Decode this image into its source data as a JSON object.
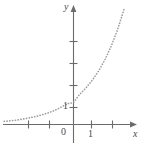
{
  "figure": {
    "background_color": "#ffffff",
    "axis_color": "#6b6b6b",
    "curve_color": "#9a9a9a",
    "text_color": "#4a4a4a"
  },
  "axes": {
    "x_axis_label": "x",
    "y_axis_label": "y",
    "origin_label": "0",
    "x_tick_label": "1",
    "y_tick_label": "1"
  },
  "chart_data": {
    "type": "line",
    "title": "",
    "xlabel": "x",
    "ylabel": "y",
    "grid": false,
    "legend": null,
    "line_style": "dotted",
    "curve_name": "exponential-growth-curve",
    "xlim": [
      -3.3,
      2.45
    ],
    "ylim": [
      -0.35,
      5.4
    ],
    "x_ticks": [
      -3,
      -2,
      -1,
      0,
      1,
      2
    ],
    "x_tick_labels": [
      "",
      "",
      "",
      "0",
      "1",
      ""
    ],
    "y_ticks": [
      1,
      2,
      3,
      4,
      5
    ],
    "y_tick_labels": [
      "1",
      "",
      "",
      "",
      ""
    ],
    "x": [
      -3.3,
      -3.0,
      -2.7,
      -2.4,
      -2.1,
      -1.8,
      -1.5,
      -1.2,
      -0.9,
      -0.6,
      -0.3,
      0.0,
      0.3,
      0.6,
      0.9,
      1.2,
      1.5,
      1.8,
      2.1,
      2.4
    ],
    "y": [
      0.14,
      0.17,
      0.2,
      0.25,
      0.3,
      0.36,
      0.44,
      0.53,
      0.64,
      0.78,
      0.94,
      1.0,
      1.38,
      1.67,
      2.02,
      2.44,
      2.95,
      3.57,
      4.32,
      5.22
    ],
    "series": [
      {
        "name": "y = e^x",
        "x": [
          -3.3,
          -3.0,
          -2.7,
          -2.4,
          -2.1,
          -1.8,
          -1.5,
          -1.2,
          -0.9,
          -0.6,
          -0.3,
          0.0,
          0.3,
          0.6,
          0.9,
          1.2,
          1.5,
          1.8,
          2.1,
          2.4
        ],
        "y": [
          0.14,
          0.17,
          0.2,
          0.25,
          0.3,
          0.36,
          0.44,
          0.53,
          0.64,
          0.78,
          0.94,
          1.0,
          1.38,
          1.67,
          2.02,
          2.44,
          2.95,
          3.57,
          4.32,
          5.22
        ]
      }
    ],
    "annotations": []
  }
}
